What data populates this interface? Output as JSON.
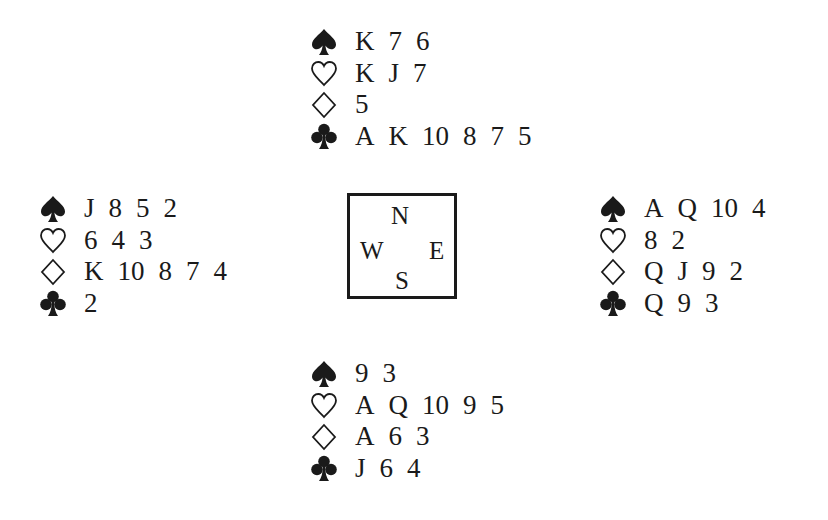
{
  "diagram": {
    "type": "bridge-deal",
    "compass": {
      "north": "N",
      "south": "S",
      "east": "E",
      "west": "W"
    },
    "suits": {
      "spades": {
        "symbol": "♠",
        "icon": "spade-icon",
        "filled": true
      },
      "hearts": {
        "symbol": "♡",
        "icon": "heart-icon",
        "filled": false
      },
      "diamonds": {
        "symbol": "◇",
        "icon": "diamond-icon",
        "filled": false
      },
      "clubs": {
        "symbol": "♣",
        "icon": "club-icon",
        "filled": true
      }
    },
    "hands": {
      "north": {
        "spades": [
          "K",
          "7",
          "6"
        ],
        "hearts": [
          "K",
          "J",
          "7"
        ],
        "diamonds": [
          "5"
        ],
        "clubs": [
          "A",
          "K",
          "10",
          "8",
          "7",
          "5"
        ]
      },
      "west": {
        "spades": [
          "J",
          "8",
          "5",
          "2"
        ],
        "hearts": [
          "6",
          "4",
          "3"
        ],
        "diamonds": [
          "K",
          "10",
          "8",
          "7",
          "4"
        ],
        "clubs": [
          "2"
        ]
      },
      "east": {
        "spades": [
          "A",
          "Q",
          "10",
          "4"
        ],
        "hearts": [
          "8",
          "2"
        ],
        "diamonds": [
          "Q",
          "J",
          "9",
          "2"
        ],
        "clubs": [
          "Q",
          "9",
          "3"
        ]
      },
      "south": {
        "spades": [
          "9",
          "3"
        ],
        "hearts": [
          "A",
          "Q",
          "10",
          "9",
          "5"
        ],
        "diamonds": [
          "A",
          "6",
          "3"
        ],
        "clubs": [
          "J",
          "6",
          "4"
        ]
      }
    }
  }
}
